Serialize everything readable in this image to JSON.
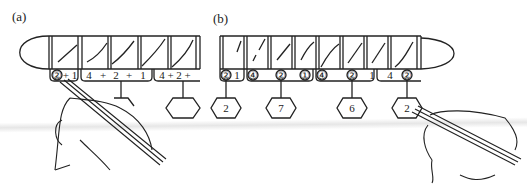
{
  "figure": {
    "panels": [
      {
        "id": "a",
        "label": "(a)",
        "groups": [
          {
            "text_parts": [
              "②",
              "+ 1"
            ],
            "result": ""
          },
          {
            "text_parts": [
              "4",
              "+",
              "2",
              "+",
              "1"
            ],
            "result": ""
          },
          {
            "text_parts": [
              "4 + 2 +"
            ],
            "result": ""
          }
        ]
      },
      {
        "id": "b",
        "label": "(b)",
        "groups": [
          {
            "text_parts": [
              "②",
              "1"
            ],
            "result": "2"
          },
          {
            "text_parts": [
              "④",
              "②",
              "①"
            ],
            "result": "7"
          },
          {
            "text_parts": [
              "④",
              "②",
              "1"
            ],
            "result": "6"
          },
          {
            "text_parts": [
              "4",
              "②"
            ],
            "result": "2"
          }
        ]
      }
    ],
    "colors": {
      "ink": "#222222",
      "background": "#ffffff"
    }
  }
}
